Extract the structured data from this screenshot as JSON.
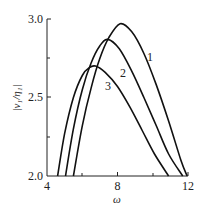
{
  "chart_data": {
    "type": "line",
    "title": "",
    "xlabel": "ω",
    "ylabel": "|ν₁/η₁|",
    "xlim": [
      4,
      12
    ],
    "ylim": [
      2.0,
      3.0
    ],
    "x_ticks": [
      "4",
      "8",
      "12"
    ],
    "x_minor_ticks": [
      6,
      10
    ],
    "y_ticks": [
      "2.0",
      "2.5",
      "3.0"
    ],
    "y_minor_ticks": [
      2.25,
      2.75
    ],
    "grid": false,
    "legend": "inline curve labels",
    "series": [
      {
        "name": "1",
        "x": [
          5.5,
          6.0,
          6.5,
          7.0,
          7.5,
          8.15,
          8.8,
          9.5,
          10.2,
          10.9,
          11.6,
          11.95
        ],
        "y": [
          2.0,
          2.32,
          2.56,
          2.75,
          2.88,
          2.97,
          2.92,
          2.78,
          2.58,
          2.35,
          2.1,
          2.0
        ]
      },
      {
        "name": "2",
        "x": [
          5.05,
          5.5,
          6.0,
          6.5,
          7.0,
          7.45,
          8.1,
          8.8,
          9.5,
          10.2,
          10.9,
          11.7
        ],
        "y": [
          2.0,
          2.3,
          2.55,
          2.72,
          2.83,
          2.87,
          2.81,
          2.67,
          2.5,
          2.32,
          2.14,
          2.0
        ]
      },
      {
        "name": "3",
        "x": [
          4.6,
          5.0,
          5.5,
          6.0,
          6.4,
          6.75,
          7.3,
          8.0,
          8.7,
          9.4,
          10.1,
          10.9
        ],
        "y": [
          2.0,
          2.27,
          2.5,
          2.64,
          2.69,
          2.7,
          2.66,
          2.57,
          2.44,
          2.29,
          2.14,
          2.0
        ]
      }
    ]
  },
  "labels": {
    "x_tick_4": "4",
    "x_tick_8": "8",
    "x_tick_12": "12",
    "y_tick_20": "2.0",
    "y_tick_25": "2.5",
    "y_tick_30": "3.0",
    "xlabel": "ω",
    "ylabel": "|ν₁/η₁|",
    "curve_1": "1",
    "curve_2": "2",
    "curve_3": "3"
  }
}
